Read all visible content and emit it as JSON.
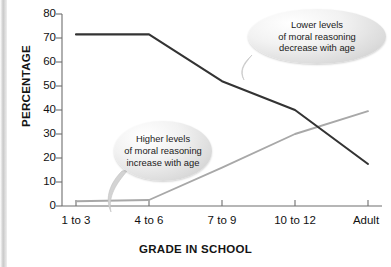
{
  "chart_data": {
    "type": "line",
    "title": "",
    "xlabel": "GRADE IN SCHOOL",
    "ylabel": "PERCENTAGE",
    "categories": [
      "1 to 3",
      "4 to 6",
      "7 to 9",
      "10 to 12",
      "Adult"
    ],
    "ylim": [
      0,
      80
    ],
    "yticks": [
      0,
      10,
      20,
      30,
      40,
      50,
      60,
      70,
      80
    ],
    "grid": false,
    "legend": "none",
    "series": [
      {
        "name": "Lower levels of moral reasoning",
        "color": "#333333",
        "values": [
          71.5,
          71.5,
          52,
          40,
          17.5
        ]
      },
      {
        "name": "Higher levels of moral reasoning",
        "color": "#a8a8a8",
        "values": [
          2,
          2.5,
          16,
          30,
          39.5
        ]
      }
    ],
    "annotations": [
      {
        "id": "upper",
        "lines": [
          "Lower levels",
          "of moral reasoning",
          "decrease with age"
        ],
        "points_to_series": "Lower levels of moral reasoning"
      },
      {
        "id": "lower",
        "lines": [
          "Higher levels",
          "of moral reasoning",
          "increase with age"
        ],
        "points_to_series": "Higher levels of moral reasoning"
      }
    ]
  },
  "axes": {
    "y_title": "PERCENTAGE",
    "x_title": "GRADE IN SCHOOL",
    "y_tick_labels": [
      "80",
      "70",
      "60",
      "50",
      "40",
      "30",
      "20",
      "10",
      "0"
    ],
    "x_tick_labels": [
      "1 to 3",
      "4 to 6",
      "7 to 9",
      "10 to 12",
      "Adult"
    ]
  },
  "callouts": {
    "upper": {
      "line1": "Lower levels",
      "line2": "of moral reasoning",
      "line3": "decrease with age"
    },
    "lower": {
      "line1": "Higher levels",
      "line2": "of moral reasoning",
      "line3": "increase with age"
    }
  },
  "colors": {
    "dark_series": "#333333",
    "light_series": "#a8a8a8",
    "axis": "#6e6e6e",
    "text": "#111111"
  }
}
